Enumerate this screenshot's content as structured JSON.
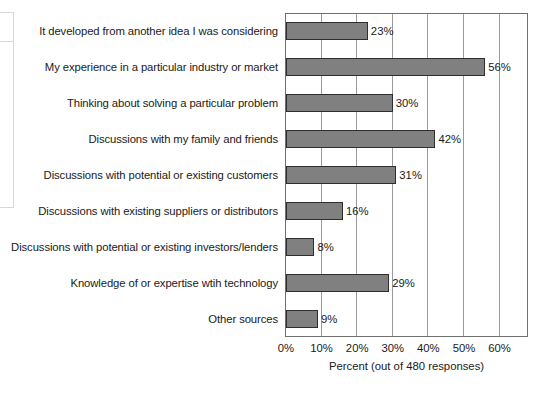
{
  "chart_data": {
    "type": "bar",
    "orientation": "horizontal",
    "title": "",
    "xlabel": "Percent (out of 480 responses)",
    "ylabel": "",
    "xlim": [
      0,
      68
    ],
    "xticks": [
      0,
      10,
      20,
      30,
      40,
      50,
      60
    ],
    "xtick_labels": [
      "0%",
      "10%",
      "20%",
      "30%",
      "40%",
      "50%",
      "60%"
    ],
    "grid": true,
    "grid_axis": "x",
    "legend": false,
    "value_label_suffix": "%",
    "categories": [
      "It developed from another idea I was considering",
      "My experience in a particular industry or market",
      "Thinking about solving a particular problem",
      "Discussions with my family and friends",
      "Discussions with potential or existing customers",
      "Discussions with existing suppliers or distributors",
      "Discussions with potential or existing investors/lenders",
      "Knowledge of or expertise wtih technology",
      "Other sources"
    ],
    "values": [
      23,
      56,
      30,
      42,
      31,
      16,
      8,
      29,
      9
    ],
    "value_labels": [
      "23%",
      "56%",
      "30%",
      "42%",
      "31%",
      "16%",
      "8%",
      "29%",
      "9%"
    ],
    "bar_fill_color": "#808080",
    "bar_border_color": "#2e2e2e",
    "plot_border_color": "#6f6f6f",
    "gridline_color": "#9a9a9a",
    "text_color": "#1a1a1a",
    "background_color": "#ffffff"
  }
}
